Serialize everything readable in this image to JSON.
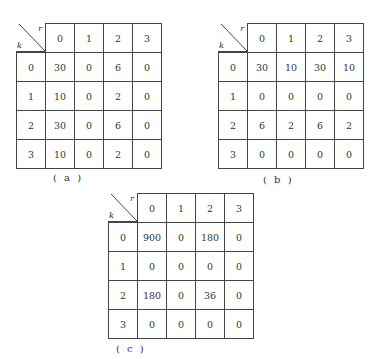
{
  "tables": [
    {
      "id": "a",
      "caption": "( a )",
      "row_axis_label": "k",
      "col_axis_label": "r",
      "col_headers": [
        "0",
        "1",
        "2",
        "3"
      ],
      "row_headers": [
        "0",
        "1",
        "2",
        "3"
      ],
      "rows": [
        [
          "30",
          "0",
          "6",
          "0"
        ],
        [
          "10",
          "0",
          "2",
          "0"
        ],
        [
          "30",
          "0",
          "6",
          "0"
        ],
        [
          "10",
          "0",
          "2",
          "0"
        ]
      ]
    },
    {
      "id": "b",
      "caption": "( b )",
      "row_axis_label": "k",
      "col_axis_label": "r",
      "col_headers": [
        "0",
        "1",
        "2",
        "3"
      ],
      "row_headers": [
        "0",
        "1",
        "2",
        "3"
      ],
      "rows": [
        [
          "30",
          "10",
          "30",
          "10"
        ],
        [
          "0",
          "0",
          "0",
          "0"
        ],
        [
          "6",
          "2",
          "6",
          "2"
        ],
        [
          "0",
          "0",
          "0",
          "0"
        ]
      ]
    },
    {
      "id": "c",
      "caption": "( c )",
      "row_axis_label": "k",
      "col_axis_label": "r",
      "col_headers": [
        "0",
        "1",
        "2",
        "3"
      ],
      "row_headers": [
        "0",
        "1",
        "2",
        "3"
      ],
      "rows": [
        [
          "900",
          "0",
          "180",
          "0"
        ],
        [
          "0",
          "0",
          "0",
          "0"
        ],
        [
          "180",
          "0",
          "36",
          "0"
        ],
        [
          "0",
          "0",
          "0",
          "0"
        ]
      ]
    }
  ]
}
